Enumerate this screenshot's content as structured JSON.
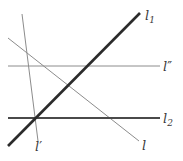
{
  "figure": {
    "width": 183,
    "height": 161,
    "background": "#ffffff"
  },
  "labels": {
    "l1": {
      "base": "l",
      "sub": "1",
      "primes": ""
    },
    "l2": {
      "base": "l",
      "sub": "2",
      "primes": ""
    },
    "l_double_prime": {
      "base": "l",
      "sub": "",
      "primes": "″"
    },
    "l_prime": {
      "base": "l",
      "sub": "",
      "primes": "′"
    },
    "l": {
      "base": "l",
      "sub": "",
      "primes": ""
    }
  },
  "colors": {
    "line_heavy": "#2b2b2b",
    "line_medium": "#4a4a4a",
    "line_light": "#8c8c8c",
    "label_text": "#3a3a3a"
  },
  "lines": {
    "l1": {
      "name": "l1",
      "style": "thick-dark-diagonal-ascending",
      "x1": 8,
      "y1": 146,
      "x2": 140,
      "y2": 13,
      "stroke": "#2b2b2b",
      "width": 2.6
    },
    "l2": {
      "name": "l2",
      "style": "medium-dark-horizontal",
      "x1": 8,
      "y1": 118,
      "x2": 160,
      "y2": 118,
      "stroke": "#4a4a4a",
      "width": 2.0
    },
    "l_double_prime": {
      "name": "l''",
      "style": "thin-gray-horizontal",
      "x1": 8,
      "y1": 66,
      "x2": 160,
      "y2": 66,
      "stroke": "#8c8c8c",
      "width": 1.0
    },
    "l_prime": {
      "name": "l'",
      "style": "thin-gray-near-vertical",
      "x1": 22,
      "y1": 14,
      "x2": 38,
      "y2": 141,
      "stroke": "#8c8c8c",
      "width": 1.0
    },
    "l": {
      "name": "l",
      "style": "thin-gray-diagonal-descending",
      "x1": 8,
      "y1": 38,
      "x2": 139,
      "y2": 141,
      "stroke": "#8c8c8c",
      "width": 1.0
    }
  },
  "intersections": [
    {
      "name": "l1-l2-lprime-concurrent",
      "x": 33,
      "y": 118
    },
    {
      "name": "l1-l-crossing",
      "x": 73,
      "y": 82
    },
    {
      "name": "l1-ldoubleprime-crossing",
      "x": 92,
      "y": 66
    },
    {
      "name": "l-lprime-crossing",
      "x": 27,
      "y": 53
    },
    {
      "name": "l-ldoubleprime-crossing",
      "x": 44,
      "y": 66
    },
    {
      "name": "l-l2-crossing",
      "x": 109,
      "y": 118
    }
  ]
}
